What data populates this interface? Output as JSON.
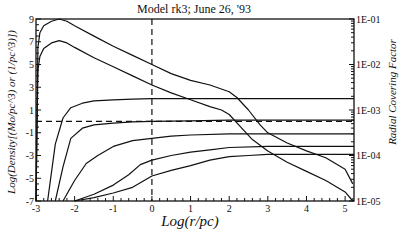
{
  "chart_data": {
    "type": "line",
    "title": "Model rk3; June 26, '93",
    "xlabel": "Log(r/pc)",
    "ylabel": "Log(Density[(Mo/pc^3) or (1/pc^3)])",
    "y2label": "Radial Covering Factor",
    "xlim": [
      -3,
      5.23
    ],
    "ylim": [
      -7,
      9
    ],
    "y2lim_log10": [
      -5,
      -1
    ],
    "x_ticks": [
      "-3",
      "-2",
      "-1",
      "0",
      "1",
      "2",
      "3",
      "4",
      "5"
    ],
    "y_ticks": [
      "9",
      "7",
      "5",
      "3",
      "1",
      "-1",
      "-3",
      "-5",
      "-7"
    ],
    "y2_ticks": [
      "1E-01",
      "1E-02",
      "1E-03",
      "1E-04",
      "1E-05"
    ],
    "grid": false,
    "reference_lines": [
      {
        "orientation": "vertical",
        "x": 0,
        "style": "dashed"
      },
      {
        "orientation": "horizontal",
        "y": 0,
        "style": "dashed"
      }
    ],
    "series": [
      {
        "name": "density-1 (upper)",
        "axis": "left",
        "x": [
          -3.0,
          -2.95,
          -2.9,
          -2.8,
          -2.6,
          -2.4,
          -2.2,
          -2.0,
          -1.5,
          -1.0,
          -0.5,
          0.0,
          0.5,
          1.0,
          1.5,
          2.0,
          2.2,
          2.5,
          2.8,
          3.0,
          3.5,
          4.0,
          4.5,
          5.0,
          5.2
        ],
        "y": [
          -7.0,
          6.5,
          7.8,
          8.4,
          8.8,
          9.0,
          8.8,
          8.4,
          7.5,
          6.6,
          5.8,
          5.0,
          4.2,
          3.6,
          3.2,
          2.6,
          2.1,
          1.0,
          -0.3,
          -1.0,
          -1.9,
          -2.6,
          -3.2,
          -4.2,
          -5.5
        ]
      },
      {
        "name": "density-2 (lower)",
        "axis": "left",
        "x": [
          -3.0,
          -2.95,
          -2.9,
          -2.8,
          -2.6,
          -2.4,
          -2.2,
          -2.0,
          -1.5,
          -1.0,
          -0.5,
          0.0,
          0.5,
          1.0,
          1.5,
          1.8,
          2.0,
          2.3,
          2.6,
          3.0,
          3.5,
          4.0,
          4.5,
          5.0,
          5.2
        ],
        "y": [
          -7.0,
          4.5,
          5.7,
          6.4,
          6.9,
          7.1,
          6.9,
          6.5,
          5.6,
          4.8,
          4.0,
          3.2,
          2.5,
          1.9,
          1.3,
          1.0,
          0.6,
          -0.5,
          -1.6,
          -2.6,
          -3.6,
          -4.4,
          -5.2,
          -6.2,
          -7.0
        ]
      },
      {
        "name": "covering-factor-1",
        "axis": "right",
        "x": [
          -2.7,
          -2.5,
          -2.3,
          -2.1,
          -1.8,
          -1.5,
          -1.0,
          -0.5,
          0.0,
          1.0,
          2.0,
          3.0,
          4.0,
          5.23
        ],
        "y": [
          -7.0,
          -2.0,
          0.3,
          1.2,
          1.6,
          1.8,
          1.9,
          1.95,
          2.0,
          2.0,
          2.0,
          2.0,
          2.0,
          2.0
        ]
      },
      {
        "name": "covering-factor-2",
        "axis": "right",
        "x": [
          -2.5,
          -2.3,
          -2.1,
          -1.8,
          -1.5,
          -1.0,
          -0.5,
          0.0,
          1.0,
          2.0,
          3.0,
          4.0,
          5.23
        ],
        "y": [
          -7.0,
          -4.0,
          -1.5,
          -0.6,
          -0.3,
          -0.15,
          -0.05,
          0.0,
          0.05,
          0.1,
          0.1,
          0.1,
          0.1
        ]
      },
      {
        "name": "covering-factor-3",
        "axis": "right",
        "x": [
          -2.3,
          -2.0,
          -1.7,
          -1.4,
          -1.0,
          -0.5,
          0.0,
          0.5,
          1.0,
          2.0,
          3.0,
          4.0,
          5.23
        ],
        "y": [
          -7.0,
          -5.2,
          -3.7,
          -3.0,
          -2.2,
          -1.7,
          -1.5,
          -1.3,
          -1.2,
          -1.1,
          -1.1,
          -1.1,
          -1.1
        ]
      },
      {
        "name": "covering-factor-4",
        "axis": "right",
        "x": [
          -2.0,
          -1.5,
          -1.0,
          -0.6,
          -0.3,
          0.0,
          0.5,
          1.0,
          1.5,
          2.0,
          3.0,
          4.0,
          5.23
        ],
        "y": [
          -7.0,
          -6.4,
          -5.6,
          -4.7,
          -3.8,
          -3.4,
          -3.0,
          -2.7,
          -2.5,
          -2.3,
          -2.2,
          -2.2,
          -2.2
        ]
      },
      {
        "name": "covering-factor-5",
        "axis": "right",
        "x": [
          -2.0,
          -1.5,
          -1.0,
          -0.5,
          0.0,
          0.5,
          1.0,
          1.5,
          2.0,
          2.5,
          3.0,
          4.0,
          5.23
        ],
        "y": [
          -7.0,
          -6.7,
          -6.3,
          -5.8,
          -4.8,
          -4.3,
          -3.9,
          -3.4,
          -3.1,
          -3.0,
          -2.9,
          -2.9,
          -2.9
        ]
      }
    ]
  },
  "plot": {
    "title": "Model rk3; June 26, '93",
    "xlabel": "Log(r/pc)",
    "ylabel": "Log(Density[(Mo/pc^3) or (1/pc^3)])",
    "y2label": "Radial Covering Factor"
  }
}
